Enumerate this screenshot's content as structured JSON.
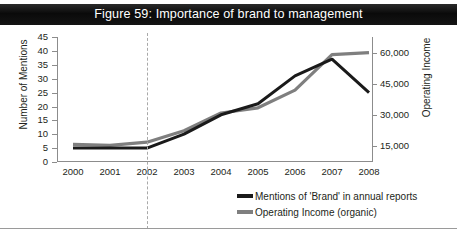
{
  "figure": {
    "title": "Figure 59: Importance of brand to management",
    "title_bar_color": "#0d0d0d",
    "title_text_color": "#ffffff"
  },
  "chart_data": {
    "type": "line",
    "title": "Figure 59: Importance of brand to management",
    "xlabel": "",
    "categories": [
      "2000",
      "2001",
      "2002",
      "2003",
      "2004",
      "2005",
      "2006",
      "2007",
      "2008"
    ],
    "grid": false,
    "legend_position": "bottom-right",
    "axes": {
      "left": {
        "label": "Number of Mentions",
        "ticks": [
          "0",
          "5",
          "10",
          "15",
          "20",
          "25",
          "30",
          "35",
          "40",
          "45"
        ],
        "min": 0,
        "max": 45
      },
      "right": {
        "label": "Operating Income",
        "ticks": [
          "15,000",
          "30,000",
          "45,000",
          "60,000"
        ],
        "min": 7500,
        "max": 67500
      }
    },
    "series": [
      {
        "name": "Mentions of 'Brand' in annual reports",
        "axis": "left",
        "color": "#1a1a1a",
        "values": [
          5,
          5,
          5,
          10,
          17,
          21,
          31,
          37,
          25
        ]
      },
      {
        "name": "Operating Income (organic)",
        "axis": "right",
        "color": "#7f7f7f",
        "values": [
          16000,
          15500,
          17000,
          22500,
          31000,
          33500,
          42000,
          59000,
          60000
        ]
      }
    ],
    "annotations": [
      {
        "type": "vertical-dashed-line",
        "at": "2002",
        "color": "#a9a9a9"
      }
    ]
  },
  "legend": {
    "items": [
      {
        "label": "Mentions of 'Brand' in annual reports",
        "color": "#1a1a1a"
      },
      {
        "label": "Operating Income (organic)",
        "color": "#7f7f7f"
      }
    ]
  }
}
